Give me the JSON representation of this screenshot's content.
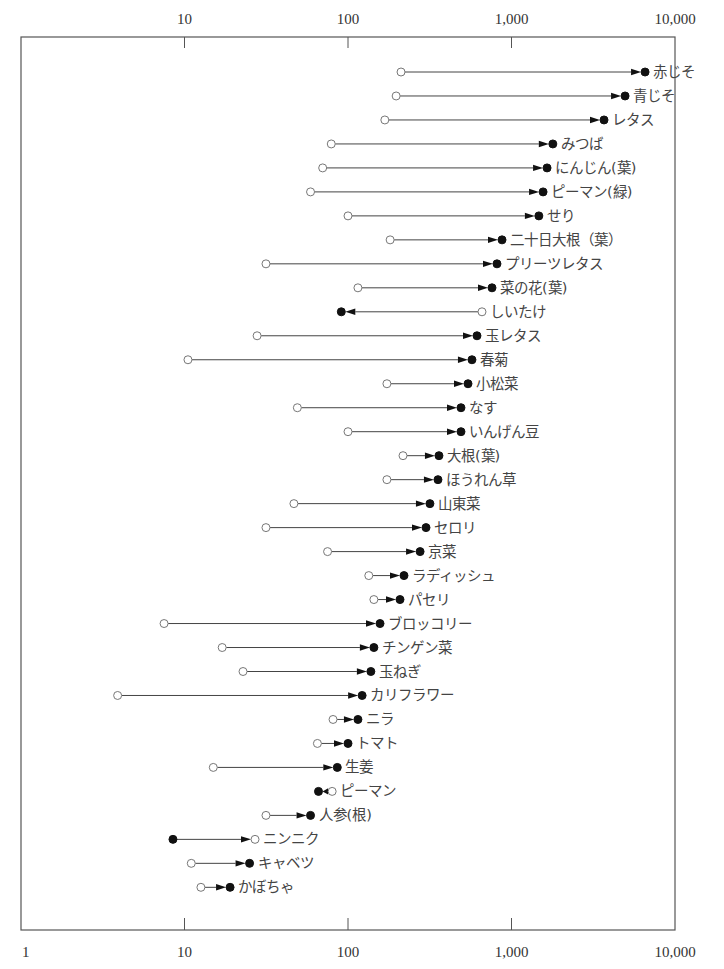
{
  "chart_data": {
    "type": "dumbbell-arrow",
    "title": "",
    "xlabel": "",
    "ylabel": "",
    "x_scale": "log",
    "xlim": [
      1,
      10000
    ],
    "top_ticks": [
      {
        "value": 10,
        "label": "10"
      },
      {
        "value": 100,
        "label": "100"
      },
      {
        "value": 1000,
        "label": "1,000"
      },
      {
        "value": 10000,
        "label": "10,000"
      }
    ],
    "bottom_ticks": [
      {
        "value": 1,
        "label": "1"
      },
      {
        "value": 10,
        "label": "10"
      },
      {
        "value": 100,
        "label": "100"
      },
      {
        "value": 1000,
        "label": "1,000"
      },
      {
        "value": 10000,
        "label": "10,000"
      }
    ],
    "legend": {
      "open_marker": "start value (open circle)",
      "filled_marker": "end value (filled circle)",
      "arrow": "direction of change"
    },
    "grid": false,
    "series": [
      {
        "label": "赤じそ",
        "open": 211,
        "filled": 6560,
        "arrow_to": "filled"
      },
      {
        "label": "青じそ",
        "open": 197,
        "filled": 4950,
        "arrow_to": "filled"
      },
      {
        "label": "レタス",
        "open": 168,
        "filled": 3680,
        "arrow_to": "filled"
      },
      {
        "label": "みつば",
        "open": 79,
        "filled": 1790,
        "arrow_to": "filled"
      },
      {
        "label": "にんじん(葉)",
        "open": 70,
        "filled": 1650,
        "arrow_to": "filled"
      },
      {
        "label": "ピーマン(緑)",
        "open": 59,
        "filled": 1560,
        "arrow_to": "filled"
      },
      {
        "label": "せり",
        "open": 100,
        "filled": 1470,
        "arrow_to": "filled"
      },
      {
        "label": "二十日大根（葉）",
        "open": 181,
        "filled": 875,
        "arrow_to": "filled"
      },
      {
        "label": "プリーツレタス",
        "open": 31.5,
        "filled": 815,
        "arrow_to": "filled"
      },
      {
        "label": "菜の花(葉)",
        "open": 115,
        "filled": 760,
        "arrow_to": "filled"
      },
      {
        "label": "しいたけ",
        "open": 660,
        "filled": 91,
        "arrow_to": "filled"
      },
      {
        "label": "玉レタス",
        "open": 27.8,
        "filled": 615,
        "arrow_to": "filled"
      },
      {
        "label": "春菊",
        "open": 10.5,
        "filled": 573,
        "arrow_to": "filled"
      },
      {
        "label": "小松菜",
        "open": 173,
        "filled": 542,
        "arrow_to": "filled"
      },
      {
        "label": "なす",
        "open": 49,
        "filled": 491,
        "arrow_to": "filled"
      },
      {
        "label": "いんげん豆",
        "open": 100,
        "filled": 491,
        "arrow_to": "filled"
      },
      {
        "label": "大根(葉)",
        "open": 217,
        "filled": 360,
        "arrow_to": "filled"
      },
      {
        "label": "ほうれん草",
        "open": 173,
        "filled": 355,
        "arrow_to": "filled"
      },
      {
        "label": "山東菜",
        "open": 46.7,
        "filled": 317,
        "arrow_to": "filled"
      },
      {
        "label": "セロリ",
        "open": 31.5,
        "filled": 300,
        "arrow_to": "filled"
      },
      {
        "label": "京菜",
        "open": 75,
        "filled": 276,
        "arrow_to": "filled"
      },
      {
        "label": "ラディッシュ",
        "open": 134,
        "filled": 220,
        "arrow_to": "filled"
      },
      {
        "label": "パセリ",
        "open": 144,
        "filled": 208,
        "arrow_to": "filled"
      },
      {
        "label": "ブロッコリー",
        "open": 7.5,
        "filled": 157,
        "arrow_to": "filled"
      },
      {
        "label": "チンゲン菜",
        "open": 17,
        "filled": 144,
        "arrow_to": "filled"
      },
      {
        "label": "玉ねぎ",
        "open": 22.8,
        "filled": 138,
        "arrow_to": "filled"
      },
      {
        "label": "カリフラワー",
        "open": 3.9,
        "filled": 122,
        "arrow_to": "filled"
      },
      {
        "label": "ニラ",
        "open": 81,
        "filled": 115,
        "arrow_to": "filled"
      },
      {
        "label": "トマト",
        "open": 65,
        "filled": 100,
        "arrow_to": "filled"
      },
      {
        "label": "生姜",
        "open": 15,
        "filled": 86,
        "arrow_to": "filled"
      },
      {
        "label": "ピーマン",
        "open": 80,
        "filled": 66,
        "arrow_to": "filled"
      },
      {
        "label": "人参(根)",
        "open": 31.5,
        "filled": 59,
        "arrow_to": "filled"
      },
      {
        "label": "ニンニク",
        "open": 27,
        "filled": 8.5,
        "arrow_to": "open"
      },
      {
        "label": "キャベツ",
        "open": 11,
        "filled": 25,
        "arrow_to": "filled"
      },
      {
        "label": "かぼちゃ",
        "open": 12.6,
        "filled": 19,
        "arrow_to": "filled"
      }
    ]
  },
  "layout": {
    "frame": {
      "left": 21,
      "right": 675,
      "top": 37,
      "bottom": 930
    },
    "px_per_decade": 163.5,
    "row_start_y": 72,
    "row_step": 23.98,
    "marker_radius": 4
  }
}
